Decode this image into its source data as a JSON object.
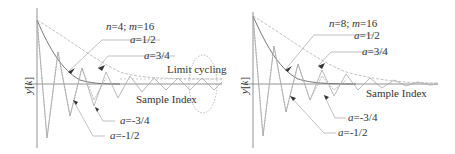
{
  "panels": [
    {
      "id": "left",
      "title": "n=4; m=16",
      "title_n": "n",
      "title_n_val": "=4; ",
      "title_m": "m",
      "title_m_val": "=16",
      "ylabel": "y[k]",
      "xlabel": "Sample Index",
      "annotation": "Limit cycling",
      "curves": [
        {
          "label_a": "a",
          "label_val": "=1/2"
        },
        {
          "label_a": "a",
          "label_val": "=3/4"
        },
        {
          "label_a": "a",
          "label_val": "=-3/4"
        },
        {
          "label_a": "a",
          "label_val": "=-1/2"
        }
      ]
    },
    {
      "id": "right",
      "title": "n=8; m=16",
      "title_n": "n",
      "title_n_val": "=8; ",
      "title_m": "m",
      "title_m_val": "=16",
      "ylabel": "y[k]",
      "xlabel": "Sample Index",
      "curves": [
        {
          "label_a": "a",
          "label_val": "=1/2"
        },
        {
          "label_a": "a",
          "label_val": "=3/4"
        },
        {
          "label_a": "a",
          "label_val": "=-3/4"
        },
        {
          "label_a": "a",
          "label_val": "=-1/2"
        }
      ]
    }
  ],
  "colors": {
    "axis": "#555555",
    "curve_dark": "#666666",
    "curve_light": "#aaaaaa",
    "text": "#333333"
  }
}
